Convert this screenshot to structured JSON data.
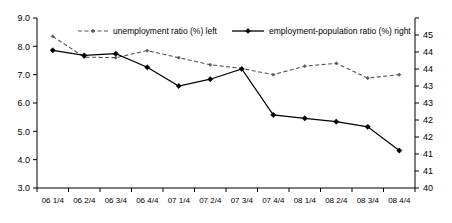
{
  "chart_data": {
    "type": "line",
    "title": "",
    "subtitle": "",
    "xlabel": "",
    "ylabel": "",
    "y2label": "",
    "grid": false,
    "legend_position": "top-inside",
    "categories": [
      "06 1/4",
      "06 2/4",
      "06 3/4",
      "06 4/4",
      "07 1/4",
      "07 2/4",
      "07 3/4",
      "07 4/4",
      "08 1/4",
      "08 2/4",
      "08 3/4",
      "08 4/4"
    ],
    "ylim": [
      3.0,
      9.0
    ],
    "yticks": [
      "3.0",
      "4.0",
      "5.0",
      "6.0",
      "7.0",
      "8.0",
      "9.0"
    ],
    "ytick_values": [
      3.0,
      4.0,
      5.0,
      6.0,
      7.0,
      8.0,
      9.0
    ],
    "y2lim": [
      40.0,
      45.0
    ],
    "y2ticks": [
      "40",
      "41",
      "41",
      "42",
      "42",
      "43",
      "43",
      "44",
      "44",
      "45"
    ],
    "y2tick_values": [
      40.0,
      40.5,
      41.0,
      41.5,
      42.0,
      42.5,
      43.0,
      43.5,
      44.0,
      44.5,
      45.0
    ],
    "series": [
      {
        "name": "unemployment ratio (%) left",
        "axis": "left",
        "style": "dashed",
        "marker": "small-diamond",
        "color": "#555555",
        "values": [
          8.35,
          7.62,
          7.6,
          7.85,
          7.6,
          7.35,
          7.22,
          7.0,
          7.3,
          7.4,
          6.88,
          7.0
        ]
      },
      {
        "name": "employment-population ratio (%) right",
        "axis": "right",
        "style": "solid",
        "marker": "diamond",
        "color": "#000000",
        "values": [
          44.05,
          43.9,
          43.95,
          43.55,
          43.0,
          43.2,
          43.5,
          42.15,
          42.05,
          41.95,
          41.8,
          41.1
        ]
      }
    ],
    "legend": [
      {
        "label": "unemployment ratio (%) left",
        "style": "dashed",
        "color": "#555555"
      },
      {
        "label": "employment-population ratio (%) right",
        "style": "solid",
        "color": "#000000"
      }
    ],
    "colors": {
      "axis": "#000000",
      "series_solid": "#000000",
      "series_dashed": "#555555",
      "background": "#ffffff"
    }
  }
}
